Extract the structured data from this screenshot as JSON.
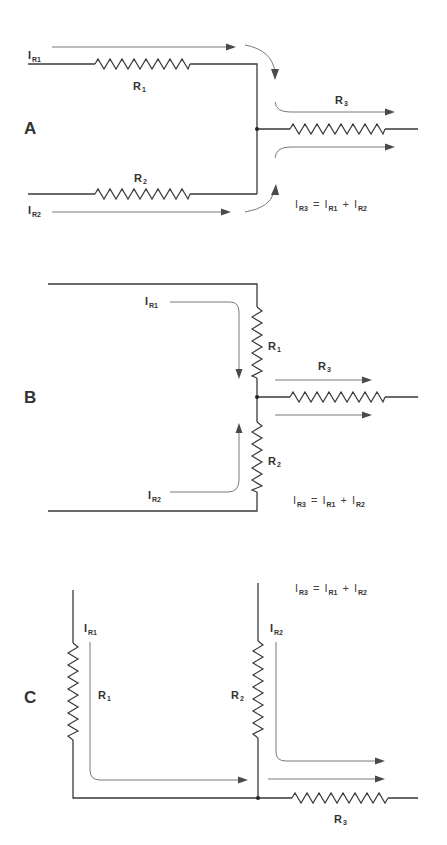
{
  "diagrams": [
    {
      "id": "A",
      "label": "A",
      "description": "Two parallel branches (R1 top, R2 bottom) joining at a junction and feeding R3",
      "resistors": {
        "r1": "R",
        "r1_sub": "1",
        "r2": "R",
        "r2_sub": "2",
        "r3": "R",
        "r3_sub": "3"
      },
      "currents": {
        "i1": "I",
        "i1_sub": "R1",
        "i2": "I",
        "i2_sub": "R2"
      },
      "equation": {
        "lhs": "I",
        "lhs_sub": "R3",
        "eq": "=",
        "t1": "I",
        "t1_sub": "R1",
        "plus": "+",
        "t2": "I",
        "t2_sub": "R2"
      }
    },
    {
      "id": "B",
      "label": "B",
      "description": "R1 and R2 in vertical leg meeting at junction feeding R3",
      "resistors": {
        "r1": "R",
        "r1_sub": "1",
        "r2": "R",
        "r2_sub": "2",
        "r3": "R",
        "r3_sub": "3"
      },
      "currents": {
        "i1": "I",
        "i1_sub": "R1",
        "i2": "I",
        "i2_sub": "R2"
      },
      "equation": {
        "lhs": "I",
        "lhs_sub": "R3",
        "eq": "=",
        "t1": "I",
        "t1_sub": "R1",
        "plus": "+",
        "t2": "I",
        "t2_sub": "R2"
      }
    },
    {
      "id": "C",
      "label": "C",
      "description": "Two vertical branches R1 and R2 joining on a bottom rail feeding R3",
      "resistors": {
        "r1": "R",
        "r1_sub": "1",
        "r2": "R",
        "r2_sub": "2",
        "r3": "R",
        "r3_sub": "3"
      },
      "currents": {
        "i1": "I",
        "i1_sub": "R1",
        "i2": "I",
        "i2_sub": "R2"
      },
      "equation": {
        "lhs": "I",
        "lhs_sub": "R3",
        "eq": "=",
        "t1": "I",
        "t1_sub": "R1",
        "plus": "+",
        "t2": "I",
        "t2_sub": "R2"
      }
    }
  ],
  "colors": {
    "ink": "#3a3a3a",
    "flow": "#6a6a6a",
    "background": "#ffffff"
  }
}
